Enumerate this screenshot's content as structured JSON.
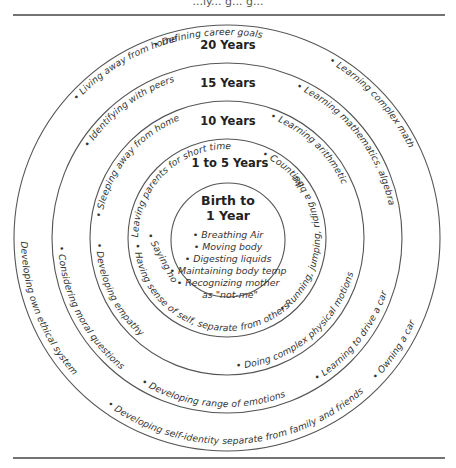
{
  "header_fragment": "...ly... g... g...",
  "rings": [
    {
      "label": "20 Years"
    },
    {
      "label": "15 Years"
    },
    {
      "label": "10 Years"
    },
    {
      "label": "1 to 5 Years"
    }
  ],
  "center": {
    "title_line1": "Birth to",
    "title_line2": "1 Year",
    "items": [
      "• Breathing Air",
      "• Moving body",
      "• Digesting liquids",
      "• Maintaining body temp",
      "• Recognizing mother",
      "as \"not-me\""
    ]
  },
  "ring_items": {
    "20_years": [
      "• Defining career goals",
      "• Learning complex math",
      "• Living away from home",
      "• Developing own ethical system",
      "• Developing self-identity separate from family and friends",
      "• Owning a car"
    ],
    "15_years": [
      "• Identifying with peers",
      "• Learning mathematics, algebra",
      "• Considering moral questions",
      "• Developing range of emotions",
      "• Learning to drive a car"
    ],
    "10_years": [
      "• Sleeping away from home",
      "• Learning arithmetic",
      "• Developing empathy",
      "• Doing complex physical motions"
    ],
    "1_to_5_years": [
      "• Leaving parents for short time",
      "• Counting",
      "• Saying no",
      "• Having sense of self, separate from others",
      "• Running, jumping, riding a bike"
    ]
  },
  "colors": {
    "stroke": "#555555",
    "text": "#333333",
    "label": "#222222",
    "background": "#ffffff"
  }
}
